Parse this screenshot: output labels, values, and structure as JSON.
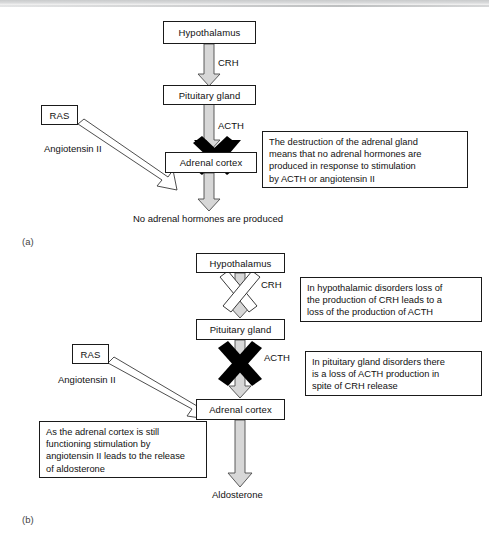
{
  "figure": {
    "type": "flow-diagram"
  },
  "panels": [
    {
      "key": "a",
      "label": "(a)",
      "nodes": [
        {
          "id": "hypothalamus",
          "text": "Hypothalamus"
        },
        {
          "id": "pituitary",
          "text": "Pituitary gland"
        },
        {
          "id": "adrenal",
          "text": "Adrenal cortex"
        },
        {
          "id": "ras",
          "text": "RAS"
        }
      ],
      "edge_labels": [
        {
          "id": "crh",
          "text": "CRH"
        },
        {
          "id": "acth",
          "text": "ACTH"
        },
        {
          "id": "angiotensin",
          "text": "Angiotensin II"
        }
      ],
      "outcome": "No adrenal hormones are produced",
      "callouts": [
        {
          "id": "adrenal-destruction",
          "lines": [
            "The destruction of the adrenal gland",
            "means that no adrenal hormones are",
            "produced in response to stimulation",
            "by ACTH or angiotensin II"
          ]
        }
      ],
      "blocks": [
        {
          "id": "adrenal-block",
          "style": "solid-black-cross",
          "on": "adrenal cortex"
        }
      ]
    },
    {
      "key": "b",
      "label": "(b)",
      "nodes": [
        {
          "id": "hypothalamus",
          "text": "Hypothalamus"
        },
        {
          "id": "pituitary",
          "text": "Pituitary gland"
        },
        {
          "id": "adrenal",
          "text": "Adrenal cortex"
        },
        {
          "id": "ras",
          "text": "RAS"
        }
      ],
      "edge_labels": [
        {
          "id": "crh",
          "text": "CRH"
        },
        {
          "id": "acth",
          "text": "ACTH"
        },
        {
          "id": "angiotensin",
          "text": "Angiotensin II"
        }
      ],
      "outcome": "Aldosterone",
      "callouts": [
        {
          "id": "hypothalamic-disorders",
          "lines": [
            "In hypothalamic disorders loss of",
            "the production of CRH leads to a",
            "loss of the production of ACTH"
          ]
        },
        {
          "id": "pituitary-disorders",
          "lines": [
            "In pituitary gland disorders there",
            "is a loss of ACTH production in",
            "spite of CRH release"
          ]
        },
        {
          "id": "adrenal-intact",
          "lines": [
            "As the adrenal cortex is still",
            "functioning stimulation by",
            "angiotensin II leads to the release",
            "of aldosterone"
          ]
        }
      ],
      "blocks": [
        {
          "id": "crh-block",
          "style": "open-white-cross",
          "on": "CRH arrow"
        },
        {
          "id": "acth-block",
          "style": "solid-black-cross",
          "on": "ACTH arrow"
        }
      ]
    }
  ],
  "colors": {
    "ink": "#111111",
    "stroke": "#1a1a1a",
    "arrow_fill": "#d7d7d7",
    "arrow_stroke": "#4a4a4a",
    "block_solid": "#000000",
    "background": "#ffffff"
  }
}
